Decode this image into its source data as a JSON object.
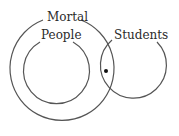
{
  "diagram": {
    "type": "euler-diagram",
    "sets": [
      {
        "name": "Mortal",
        "label": "Mortal"
      },
      {
        "name": "People",
        "label": "People"
      },
      {
        "name": "Students",
        "label": "Students"
      }
    ],
    "point": {
      "label": "",
      "location": "in Students and Mortal, not People"
    },
    "stroke_color": "#555555",
    "text_color": "#2a2a2a"
  }
}
